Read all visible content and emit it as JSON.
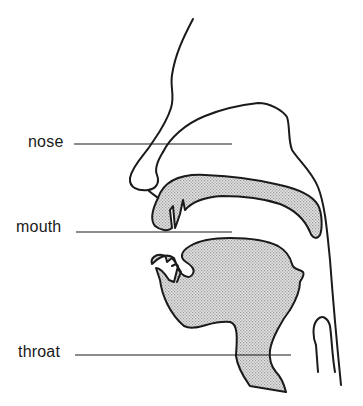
{
  "diagram": {
    "title": "",
    "labels": [
      {
        "id": "nose",
        "text": "nose",
        "x": 28,
        "y": 134,
        "line": {
          "x1": 74,
          "y1": 144,
          "x2": 232,
          "y2": 144
        }
      },
      {
        "id": "mouth",
        "text": "mouth",
        "x": 16,
        "y": 219,
        "line": {
          "x1": 76,
          "y1": 232,
          "x2": 232,
          "y2": 232
        }
      },
      {
        "id": "throat",
        "text": "throat",
        "x": 18,
        "y": 344,
        "line": {
          "x1": 75,
          "y1": 355,
          "x2": 291,
          "y2": 355
        }
      }
    ],
    "colors": {
      "stroke": "#1a1a1a",
      "shade": "#c8c8c8",
      "background": "#ffffff"
    }
  }
}
